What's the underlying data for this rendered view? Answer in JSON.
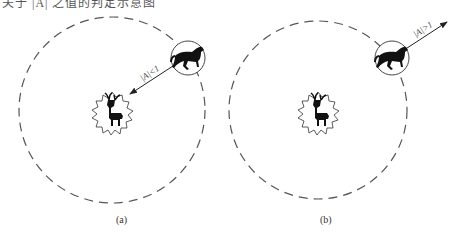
{
  "header": {
    "cut_text": "关于 |A| 之值的判定示意图"
  },
  "panels": [
    {
      "id": "a",
      "caption": "(a)",
      "condition_label": "|A|<1",
      "arrow_direction": "toward-prey",
      "predator_icon": "horse-icon",
      "prey_icon": "deer-icon"
    },
    {
      "id": "b",
      "caption": "(b)",
      "condition_label": "|A|>1",
      "arrow_direction": "away-from-prey",
      "predator_icon": "horse-icon",
      "prey_icon": "deer-icon"
    }
  ],
  "colors": {
    "line": "#333333",
    "dash": "#555555",
    "silhouette": "#111111"
  }
}
